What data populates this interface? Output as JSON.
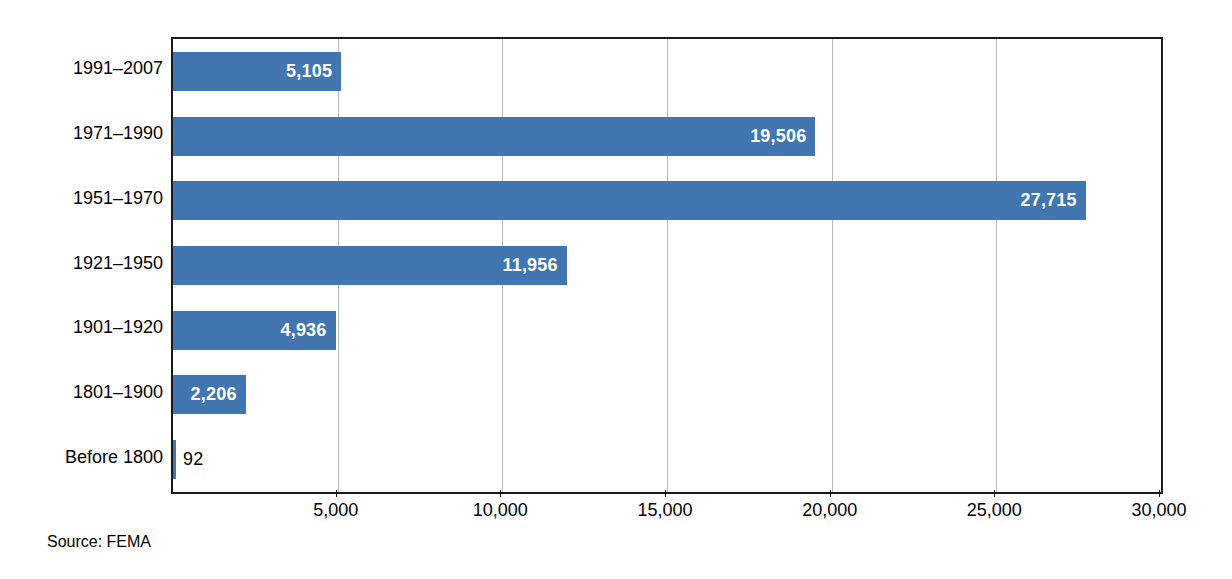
{
  "chart_data": {
    "type": "bar",
    "orientation": "horizontal",
    "title": "",
    "subtitle": "",
    "xlabel": "",
    "ylabel": "",
    "categories": [
      "1991–2007",
      "1971–1990",
      "1951–1970",
      "1921–1950",
      "1901–1920",
      "1801–1900",
      "Before 1800"
    ],
    "values": [
      5105,
      19506,
      27715,
      11956,
      4936,
      2206,
      92
    ],
    "value_labels": [
      "5,105",
      "19,506",
      "27,715",
      "11,956",
      "4,936",
      "2,206",
      "92"
    ],
    "label_placement": [
      "inside",
      "inside",
      "inside",
      "inside",
      "inside",
      "inside",
      "outside"
    ],
    "xlim": [
      0,
      30000
    ],
    "xticks": [
      0,
      5000,
      10000,
      15000,
      20000,
      25000,
      30000
    ],
    "xtick_labels": [
      "",
      "5,000",
      "10,000",
      "15,000",
      "20,000",
      "25,000",
      "30,000"
    ],
    "gridlines": [
      5000,
      10000,
      15000,
      20000,
      25000
    ],
    "grid": true,
    "legend": false,
    "bar_color": "#4176b0",
    "inside_label_color": "#ffffff",
    "outside_label_color": "#000000",
    "axis_color": "#1a1a1a",
    "grid_color": "#b9b9b9",
    "background": "#ffffff"
  },
  "footer": {
    "source": "Source: FEMA"
  }
}
